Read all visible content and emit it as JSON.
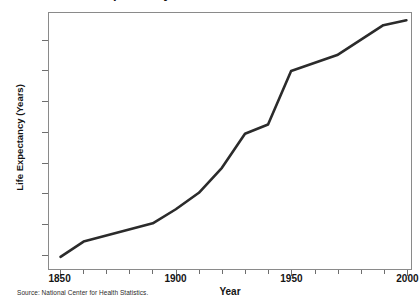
{
  "chart_data": {
    "type": "line",
    "title": "Life Expectancy at Birth in the United States",
    "xlabel": "Year",
    "ylabel": "Life Expectancy (Years)",
    "xlim": [
      1845,
      2002
    ],
    "ylim": [
      37.5,
      79.5
    ],
    "grid": false,
    "legend": null,
    "source": "Source: National Center for Health Statistics.",
    "x_ticks_major": [
      1850,
      1900,
      1950,
      2000
    ],
    "x_tick_labels": [
      "1850",
      "1900",
      "1950",
      "2000"
    ],
    "x_ticks_minor": [
      1860,
      1870,
      1880,
      1890,
      1910,
      1920,
      1930,
      1940,
      1960,
      1970,
      1980,
      1990
    ],
    "y_ticks": [
      40,
      45,
      50,
      55,
      60,
      65,
      70,
      75
    ],
    "y_tick_labels": [
      "40",
      "45",
      "50",
      "55",
      "60",
      "65",
      "70",
      "75"
    ],
    "line_color": "#2b2b2b",
    "line_width": 2.6,
    "x": [
      1850,
      1860,
      1890,
      1900,
      1910,
      1920,
      1930,
      1940,
      1950,
      1970,
      1990,
      2000
    ],
    "values": [
      39.5,
      42.0,
      45.0,
      47.3,
      50.0,
      54.1,
      59.7,
      61.2,
      70.0,
      72.6,
      77.5,
      78.3
    ],
    "series": [
      {
        "name": "Life expectancy at birth",
        "points": [
          {
            "year": 1850,
            "value": 39.5
          },
          {
            "year": 1860,
            "value": 42.0
          },
          {
            "year": 1890,
            "value": 45.0
          },
          {
            "year": 1900,
            "value": 47.3
          },
          {
            "year": 1910,
            "value": 50.0
          },
          {
            "year": 1920,
            "value": 54.1
          },
          {
            "year": 1930,
            "value": 59.7
          },
          {
            "year": 1940,
            "value": 61.2
          },
          {
            "year": 1950,
            "value": 70.0
          },
          {
            "year": 1970,
            "value": 72.6
          },
          {
            "year": 1990,
            "value": 77.5
          },
          {
            "year": 2000,
            "value": 78.3
          }
        ]
      }
    ]
  }
}
